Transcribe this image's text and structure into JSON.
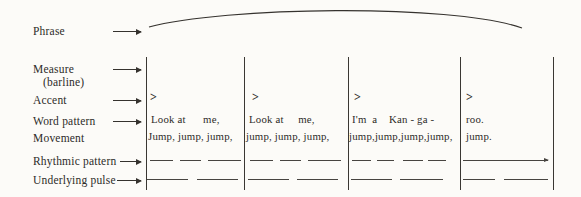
{
  "diagram": {
    "phrase_label": "Phrase",
    "measure_label": "Measure",
    "measure_sublabel": "(barline)",
    "accent_label": "Accent",
    "word_pattern_label": "Word pattern",
    "movement_label": "Movement",
    "rhythmic_pattern_label": "Rhythmic pattern",
    "underlying_pulse_label": "Underlying pulse"
  },
  "measures": [
    {
      "accent": ">",
      "word_pattern": "Look at      me,",
      "movement": "Jump, jump, jump,"
    },
    {
      "accent": ">",
      "word_pattern": "Look at     me,",
      "movement": "jump, jump, jump,"
    },
    {
      "accent": ">",
      "word_pattern": "I'm  a    Kan - ga -",
      "movement": "jump,jump,jump,jump,"
    },
    {
      "accent": ">",
      "word_pattern": "roo.",
      "movement": "jump."
    }
  ],
  "notation": {
    "barlines_x": [
      146,
      244,
      348,
      460,
      553
    ],
    "rhythmic_dashes": [
      [
        [
          150,
          23
        ],
        [
          180,
          21
        ],
        [
          208,
          33
        ]
      ],
      [
        [
          250,
          23
        ],
        [
          280,
          21
        ],
        [
          308,
          33
        ]
      ],
      [
        [
          352,
          19
        ],
        [
          377,
          17
        ],
        [
          403,
          20
        ],
        [
          428,
          18
        ]
      ],
      [
        [
          463,
          85,
          "arrow"
        ]
      ]
    ],
    "pulse_dashes": [
      [
        [
          147,
          41
        ],
        [
          197,
          41
        ]
      ],
      [
        [
          248,
          41
        ],
        [
          297,
          41
        ]
      ],
      [
        [
          351,
          41
        ],
        [
          400,
          43
        ]
      ],
      [
        [
          463,
          32
        ],
        [
          504,
          44
        ]
      ]
    ]
  },
  "colors": {
    "ink": "#2d2b28",
    "paper": "#fcfbf8"
  }
}
